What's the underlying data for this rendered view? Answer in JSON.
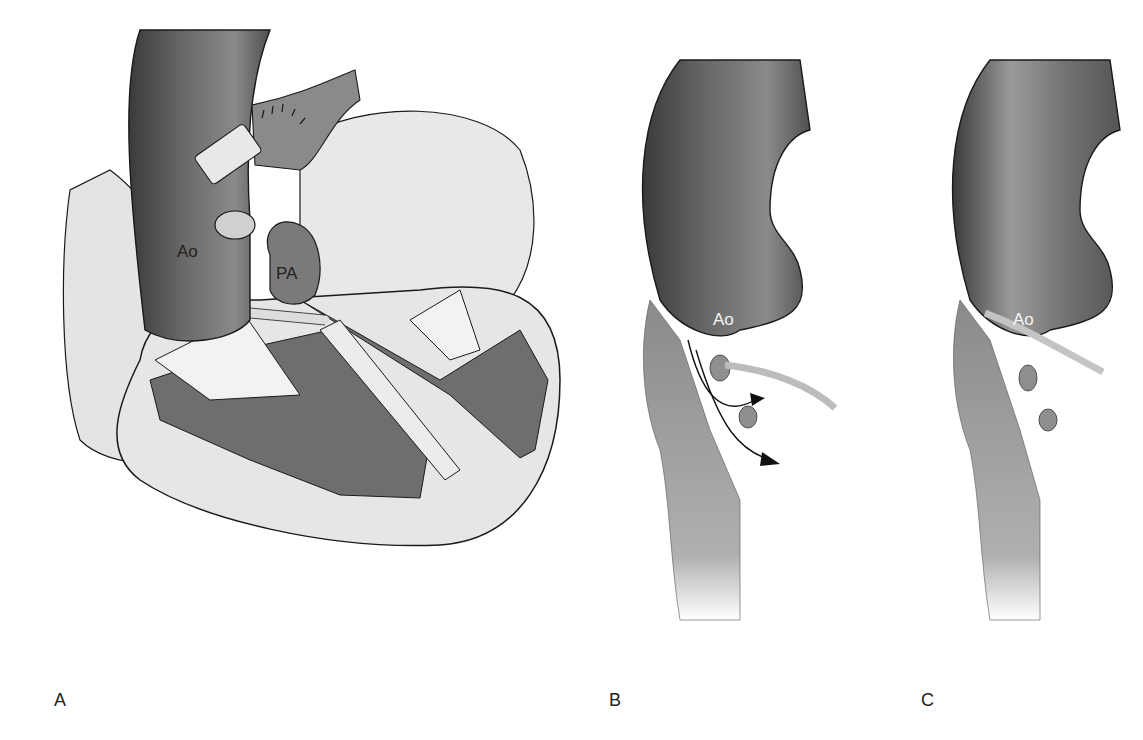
{
  "figure": {
    "panels": [
      {
        "id": "A",
        "label": "A",
        "structures": [
          {
            "label": "Ao"
          },
          {
            "label": "PA"
          }
        ]
      },
      {
        "id": "B",
        "label": "B",
        "structures": [
          {
            "label": "Ao"
          }
        ]
      },
      {
        "id": "C",
        "label": "C",
        "structures": [
          {
            "label": "Ao"
          }
        ]
      }
    ]
  },
  "colors": {
    "dark_tissue": "#6e6e6e",
    "aorta": "#5a5a5a",
    "light_tissue": "#e6e6e6",
    "outline": "#1a1a1a"
  }
}
